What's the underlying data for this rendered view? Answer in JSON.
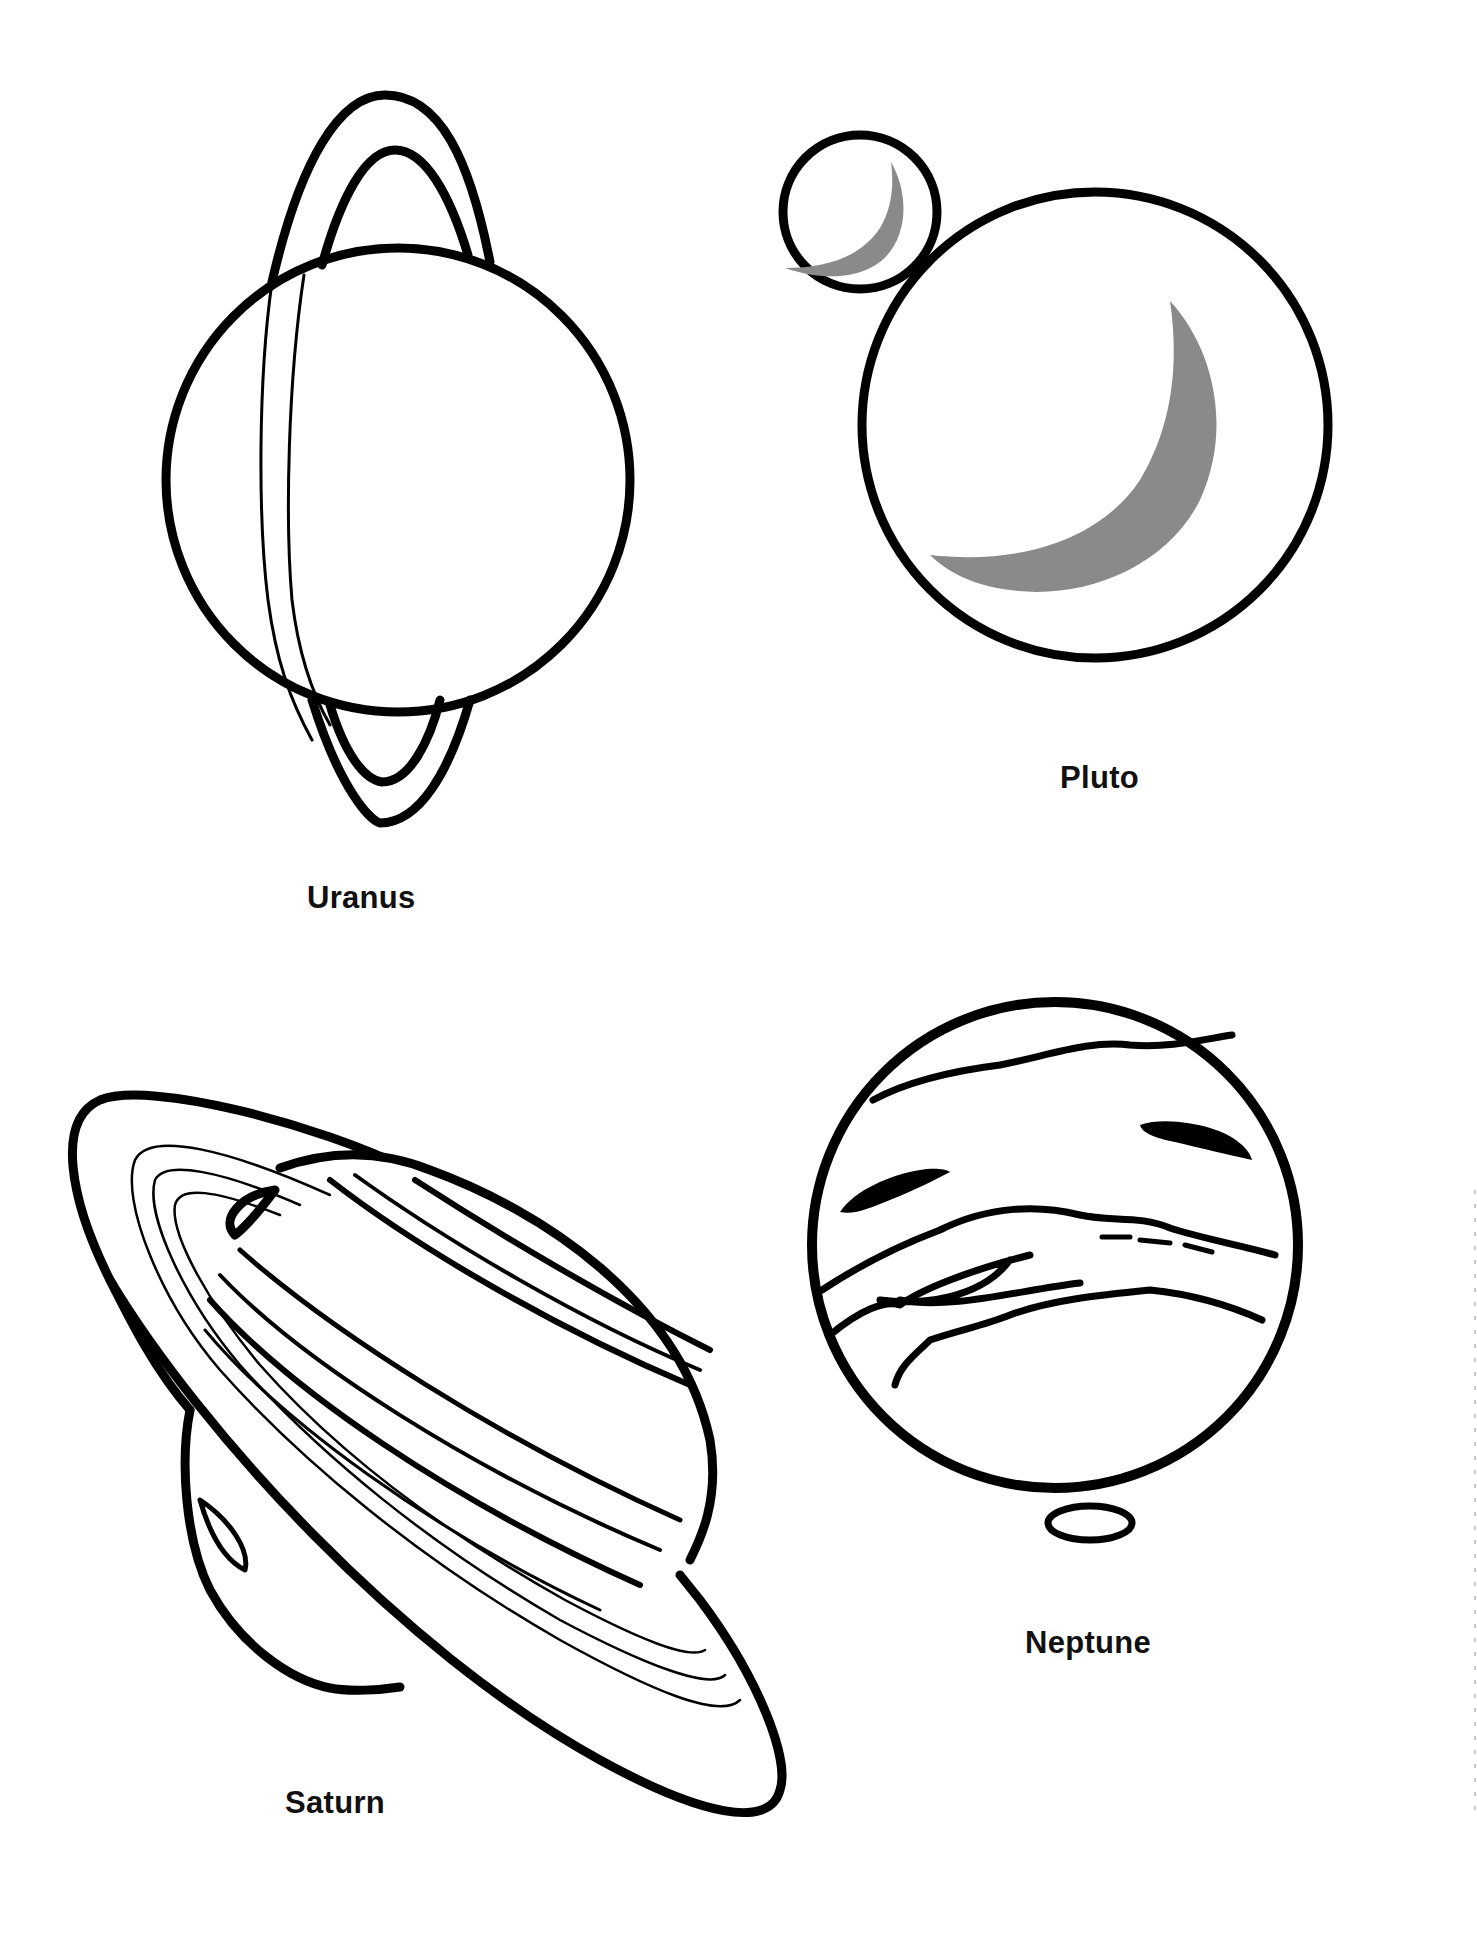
{
  "page": {
    "type": "coloring-page",
    "colors": {
      "background": "#ffffff",
      "line": "#000000",
      "shade": "#8a8a8a",
      "label": "#111111"
    }
  },
  "planets": [
    {
      "id": "uranus",
      "label": "Uranus",
      "label_pos": {
        "x": 307,
        "y": 880
      }
    },
    {
      "id": "pluto",
      "label": "Pluto",
      "label_pos": {
        "x": 1060,
        "y": 760
      }
    },
    {
      "id": "saturn",
      "label": "Saturn",
      "label_pos": {
        "x": 285,
        "y": 1785
      }
    },
    {
      "id": "neptune",
      "label": "Neptune",
      "label_pos": {
        "x": 1025,
        "y": 1625
      }
    }
  ]
}
